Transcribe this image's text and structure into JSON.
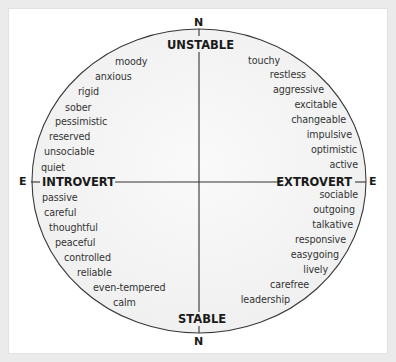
{
  "diagram": {
    "type": "personality-circle",
    "compass": {
      "top": "N",
      "bottom": "N",
      "left": "E",
      "right": "E"
    },
    "axes": {
      "top": "UNSTABLE",
      "bottom": "STABLE",
      "left": "INTROVERT",
      "right": "EXTROVERT"
    },
    "quadrants": {
      "unstable_introvert": [
        "moody",
        "anxious",
        "rigid",
        "sober",
        "pessimistic",
        "reserved",
        "unsociable",
        "quiet"
      ],
      "unstable_extrovert": [
        "touchy",
        "restless",
        "aggressive",
        "excitable",
        "changeable",
        "impulsive",
        "optimistic",
        "active"
      ],
      "stable_introvert": [
        "passive",
        "careful",
        "thoughtful",
        "peaceful",
        "controlled",
        "reliable",
        "even-tempered",
        "calm"
      ],
      "stable_extrovert": [
        "sociable",
        "outgoing",
        "talkative",
        "responsive",
        "easygoing",
        "lively",
        "carefree",
        "leadership"
      ]
    },
    "colors": {
      "background": "#ebebeb",
      "panel": "#ffffff",
      "circle_fill": "#f3f3f3",
      "line": "#333333",
      "text": "#333333"
    }
  }
}
